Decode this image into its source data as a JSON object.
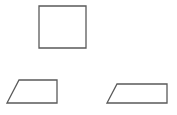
{
  "canvas": {
    "width": 177,
    "height": 115,
    "background": "#ffffff"
  },
  "style": {
    "stroke": "#5a5a5a",
    "stroke_width": 1.3,
    "fill": "#ffffff"
  },
  "shapes": [
    {
      "id": "square",
      "type": "square",
      "points": "39,6 86,6 86,48 39,48"
    },
    {
      "id": "left-trapezoid",
      "type": "right-trapezoid",
      "points": "19,80 57,80 57,103 7,103"
    },
    {
      "id": "right-trapezoid",
      "type": "right-trapezoid",
      "points": "117,84 167,84 167,103 107,103"
    }
  ]
}
